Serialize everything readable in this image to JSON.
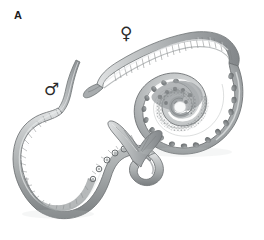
{
  "figure": {
    "panel_label": "A",
    "background_color": "#ffffff",
    "width": 264,
    "height": 240,
    "style": "grayscale-scientific-illustration"
  },
  "annotations": [
    {
      "id": "female-symbol",
      "glyph": "♀",
      "meaning": "female",
      "x": 120,
      "y": 25,
      "color": "#2b2b2b"
    },
    {
      "id": "male-symbol",
      "glyph": "♂",
      "meaning": "male",
      "x": 44,
      "y": 81,
      "color": "#2b2b2b"
    }
  ],
  "organisms": {
    "female": {
      "label": "female-worm",
      "description": "Large coiled female nematode spiralling inward, head tapering at upper left, body segmented with dark ovoid eggs along the outer coil and fine granular developing eggs in the inner whorls.",
      "body_fill": "#b9bcbd",
      "body_shade": "#8e9294",
      "outline": "#6f7375",
      "egg_fill": "#7b7f81",
      "highlight": "#dcdedf"
    },
    "male": {
      "label": "male-worm",
      "description": "Smaller slender male nematode with undulating S-shaped body, thin anterior end at top, thickened posterior ending in a curled fan-shaped copulatory bursa.",
      "body_fill": "#bcbfc0",
      "body_shade": "#909496",
      "outline": "#6f7375",
      "egg_fill": "#8a8e90",
      "highlight": "#e0e2e3"
    }
  },
  "palette": {
    "background": "#ffffff",
    "ink": "#1b1b1b",
    "mid_gray": "#9a9e9f",
    "light_gray": "#d4d6d7",
    "dark_gray": "#6a6e70"
  }
}
